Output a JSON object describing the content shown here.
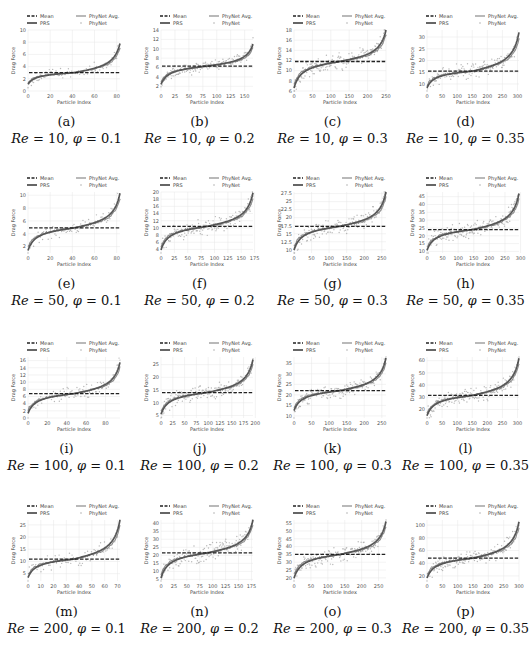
{
  "figure": {
    "legend": {
      "mean": "Mean",
      "prs": "PRS",
      "phynet_avg": "PhyNet Avg.",
      "phynet": "PhyNet"
    },
    "xlabel": "Particle Index",
    "ylabel": "Drag Force",
    "colors": {
      "mean": "#222222",
      "prs": "#555555",
      "phynet_avg": "#8a8a8a",
      "phynet": "#b0b0b0",
      "grid": "#e6e6e6"
    }
  },
  "chart_data": [
    {
      "id": "a",
      "caption": "(a)",
      "re": "10",
      "phi": "0.1",
      "type": "line",
      "xlabel": "Particle Index",
      "ylabel": "Drag Force",
      "xticks": [
        0,
        20,
        40,
        60,
        80
      ],
      "yticks": [
        0,
        2,
        4,
        6,
        8,
        10
      ],
      "xlim": [
        0,
        83
      ],
      "ylim": [
        0,
        10
      ],
      "mean": 3.0,
      "prs_range": [
        1.0,
        7.8
      ],
      "n": 83,
      "legend": [
        "Mean",
        "PRS",
        "PhyNet Avg.",
        "PhyNet"
      ]
    },
    {
      "id": "b",
      "caption": "(b)",
      "re": "10",
      "phi": "0.2",
      "type": "line",
      "xlabel": "Particle Index",
      "ylabel": "Drag Force",
      "xticks": [
        0,
        25,
        50,
        75,
        100,
        125,
        150
      ],
      "yticks": [
        2,
        4,
        6,
        8,
        10,
        12,
        14
      ],
      "xlim": [
        0,
        165
      ],
      "ylim": [
        1,
        14
      ],
      "mean": 6.3,
      "prs_range": [
        2.2,
        11.0
      ],
      "n": 165,
      "legend": [
        "Mean",
        "PRS",
        "PhyNet Avg.",
        "PhyNet"
      ]
    },
    {
      "id": "c",
      "caption": "(c)",
      "re": "10",
      "phi": "0.3",
      "type": "line",
      "xlabel": "Particle Index",
      "ylabel": "Drag Force",
      "xticks": [
        0,
        50,
        100,
        150,
        200,
        250
      ],
      "yticks": [
        6,
        8,
        10,
        12,
        14,
        16,
        18
      ],
      "xlim": [
        0,
        250
      ],
      "ylim": [
        6,
        18
      ],
      "mean": 11.8,
      "prs_range": [
        6.3,
        18.0
      ],
      "n": 250,
      "legend": [
        "Mean",
        "PRS",
        "PhyNet Avg.",
        "PhyNet"
      ]
    },
    {
      "id": "d",
      "caption": "(d)",
      "re": "10",
      "phi": "0.35",
      "type": "line",
      "xlabel": "Particle Index",
      "ylabel": "Drag Force",
      "xticks": [
        0,
        50,
        100,
        150,
        200,
        250,
        300
      ],
      "yticks": [
        10,
        15,
        20,
        25,
        30
      ],
      "xlim": [
        0,
        305
      ],
      "ylim": [
        7,
        33
      ],
      "mean": 15.5,
      "prs_range": [
        8.0,
        32.0
      ],
      "n": 305,
      "legend": [
        "Mean",
        "PRS",
        "PhyNet Avg.",
        "PhyNet"
      ]
    },
    {
      "id": "e",
      "caption": "(e)",
      "re": "50",
      "phi": "0.1",
      "type": "line",
      "xlabel": "Particle Index",
      "ylabel": "Drag Force",
      "xticks": [
        0,
        20,
        40,
        60,
        80
      ],
      "yticks": [
        2,
        4,
        6,
        8,
        10
      ],
      "xlim": [
        0,
        83
      ],
      "ylim": [
        1,
        10.5
      ],
      "mean": 4.9,
      "prs_range": [
        1.2,
        10.3
      ],
      "n": 83,
      "legend": [
        "Mean",
        "PRS",
        "PhyNet Avg.",
        "PhyNet"
      ]
    },
    {
      "id": "f",
      "caption": "(f)",
      "re": "50",
      "phi": "0.2",
      "type": "line",
      "xlabel": "Particle Index",
      "ylabel": "Drag Force",
      "xticks": [
        0,
        25,
        50,
        75,
        100,
        125,
        150,
        175
      ],
      "yticks": [
        4,
        6,
        8,
        10,
        12,
        14,
        16,
        18,
        20
      ],
      "xlim": [
        0,
        172
      ],
      "ylim": [
        3,
        20
      ],
      "mean": 10.4,
      "prs_range": [
        3.5,
        19.8
      ],
      "n": 172,
      "legend": [
        "Mean",
        "PRS",
        "PhyNet Avg.",
        "PhyNet"
      ]
    },
    {
      "id": "g",
      "caption": "(g)",
      "re": "50",
      "phi": "0.3",
      "type": "line",
      "xlabel": "Particle Index",
      "ylabel": "Drag Force",
      "xticks": [
        0,
        50,
        100,
        150,
        200,
        250
      ],
      "yticks": [
        10.0,
        12.5,
        15.0,
        17.5,
        20.0,
        22.5,
        25.0,
        27.5
      ],
      "xlim": [
        0,
        262
      ],
      "ylim": [
        9,
        28
      ],
      "mean": 17.3,
      "prs_range": [
        9.5,
        28.0
      ],
      "n": 262,
      "legend": [
        "Mean",
        "PRS",
        "PhyNet Avg.",
        "PhyNet"
      ]
    },
    {
      "id": "h",
      "caption": "(h)",
      "re": "50",
      "phi": "0.35",
      "type": "line",
      "xlabel": "Particle Index",
      "ylabel": "Drag Force",
      "xticks": [
        0,
        50,
        100,
        150,
        200,
        250,
        300
      ],
      "yticks": [
        10,
        15,
        20,
        25,
        30,
        35,
        40,
        45
      ],
      "xlim": [
        0,
        295
      ],
      "ylim": [
        9,
        48
      ],
      "mean": 24.0,
      "prs_range": [
        10.0,
        47.0
      ],
      "n": 295,
      "legend": [
        "Mean",
        "PRS",
        "PhyNet Avg.",
        "PhyNet"
      ]
    },
    {
      "id": "i",
      "caption": "(i)",
      "re": "100",
      "phi": "0.1",
      "type": "line",
      "xlabel": "Particle Index",
      "ylabel": "Drag Force",
      "xticks": [
        0,
        20,
        40,
        60,
        80
      ],
      "yticks": [
        0,
        2,
        4,
        6,
        8,
        10,
        12,
        14,
        16
      ],
      "xlim": [
        0,
        95
      ],
      "ylim": [
        0,
        17
      ],
      "mean": 6.8,
      "prs_range": [
        1.0,
        15.5
      ],
      "n": 95,
      "legend": [
        "Mean",
        "PRS",
        "PhyNet Avg.",
        "PhyNet"
      ]
    },
    {
      "id": "j",
      "caption": "(j)",
      "re": "100",
      "phi": "0.2",
      "type": "line",
      "xlabel": "Particle Index",
      "ylabel": "Drag Force",
      "xticks": [
        0,
        25,
        50,
        75,
        100,
        125,
        150,
        175,
        200
      ],
      "yticks": [
        5,
        10,
        15,
        20,
        25
      ],
      "xlim": [
        0,
        195
      ],
      "ylim": [
        4,
        28
      ],
      "mean": 14.0,
      "prs_range": [
        5.0,
        27.0
      ],
      "n": 195,
      "legend": [
        "Mean",
        "PRS",
        "PhyNet Avg.",
        "PhyNet"
      ]
    },
    {
      "id": "k",
      "caption": "(k)",
      "re": "100",
      "phi": "0.3",
      "type": "line",
      "xlabel": "Particle Index",
      "ylabel": "Drag Force",
      "xticks": [
        0,
        50,
        100,
        150,
        200,
        250
      ],
      "yticks": [
        10,
        15,
        20,
        25,
        30,
        35
      ],
      "xlim": [
        0,
        262
      ],
      "ylim": [
        9,
        38
      ],
      "mean": 22.0,
      "prs_range": [
        12.0,
        37.5
      ],
      "n": 262,
      "legend": [
        "Mean",
        "PRS",
        "PhyNet Avg.",
        "PhyNet"
      ]
    },
    {
      "id": "l",
      "caption": "(l)",
      "re": "100",
      "phi": "0.35",
      "type": "line",
      "xlabel": "Particle Index",
      "ylabel": "Drag Force",
      "xticks": [
        0,
        50,
        100,
        150,
        200,
        250,
        300
      ],
      "yticks": [
        20,
        30,
        40,
        50,
        60
      ],
      "xlim": [
        0,
        305
      ],
      "ylim": [
        13,
        63
      ],
      "mean": 31.5,
      "prs_range": [
        14.0,
        62.0
      ],
      "n": 305,
      "legend": [
        "Mean",
        "PRS",
        "PhyNet Avg.",
        "PhyNet"
      ]
    },
    {
      "id": "m",
      "caption": "(m)",
      "re": "200",
      "phi": "0.1",
      "type": "line",
      "xlabel": "Particle Index",
      "ylabel": "Drag Force",
      "xticks": [
        0,
        10,
        20,
        30,
        40,
        50,
        60,
        70
      ],
      "yticks": [
        5,
        10,
        15,
        20,
        25
      ],
      "xlim": [
        0,
        72
      ],
      "ylim": [
        2,
        27
      ],
      "mean": 11.0,
      "prs_range": [
        3.0,
        27.0
      ],
      "n": 72,
      "legend": [
        "Mean",
        "PRS",
        "PhyNet Avg.",
        "PhyNet"
      ]
    },
    {
      "id": "n",
      "caption": "(n)",
      "re": "200",
      "phi": "0.2",
      "type": "line",
      "xlabel": "Particle Index",
      "ylabel": "Drag Force",
      "xticks": [
        0,
        25,
        50,
        75,
        100,
        125,
        150,
        175
      ],
      "yticks": [
        5,
        10,
        15,
        20,
        25,
        30,
        35,
        40
      ],
      "xlim": [
        0,
        178
      ],
      "ylim": [
        4,
        42
      ],
      "mean": 21.5,
      "prs_range": [
        5.0,
        42.0
      ],
      "n": 178,
      "legend": [
        "Mean",
        "PRS",
        "PhyNet Avg.",
        "PhyNet"
      ]
    },
    {
      "id": "o",
      "caption": "(o)",
      "re": "200",
      "phi": "0.3",
      "type": "line",
      "xlabel": "Particle Index",
      "ylabel": "Drag Force",
      "xticks": [
        0,
        50,
        100,
        150,
        200,
        250
      ],
      "yticks": [
        20,
        25,
        30,
        35,
        40,
        45,
        50,
        55
      ],
      "xlim": [
        0,
        272
      ],
      "ylim": [
        18,
        57
      ],
      "mean": 35.0,
      "prs_range": [
        19.0,
        56.0
      ],
      "n": 272,
      "legend": [
        "Mean",
        "PRS",
        "PhyNet Avg.",
        "PhyNet"
      ]
    },
    {
      "id": "p",
      "caption": "(p)",
      "re": "200",
      "phi": "0.35",
      "type": "line",
      "xlabel": "Particle Index",
      "ylabel": "Drag Force",
      "xticks": [
        0,
        50,
        100,
        150,
        200,
        250,
        300
      ],
      "yticks": [
        20,
        40,
        60,
        80,
        100
      ],
      "xlim": [
        0,
        300
      ],
      "ylim": [
        12,
        108
      ],
      "mean": 48.0,
      "prs_range": [
        15.0,
        105.0
      ],
      "n": 290,
      "legend": [
        "Mean",
        "PRS",
        "PhyNet Avg.",
        "PhyNet"
      ]
    }
  ]
}
